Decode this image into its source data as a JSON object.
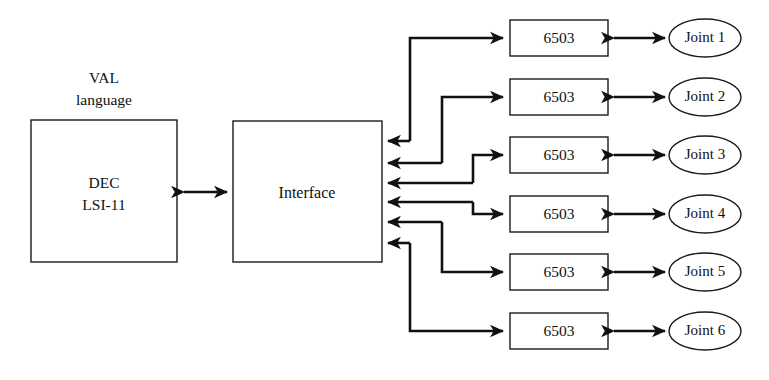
{
  "diagram": {
    "background_color": "#ffffff",
    "line_color": "#111111",
    "text_color": "#101010",
    "annotation": {
      "val_label_line1": "VAL",
      "val_label_line2": "language"
    },
    "computer": {
      "label_line1": "DEC",
      "label_line2": "LSI-11"
    },
    "interface": {
      "label": "Interface"
    },
    "processors": [
      {
        "label": "6503"
      },
      {
        "label": "6503"
      },
      {
        "label": "6503"
      },
      {
        "label": "6503"
      },
      {
        "label": "6503"
      },
      {
        "label": "6503"
      }
    ],
    "joints": [
      {
        "label": "Joint 1"
      },
      {
        "label": "Joint 2"
      },
      {
        "label": "Joint 3"
      },
      {
        "label": "Joint 4"
      },
      {
        "label": "Joint 5"
      },
      {
        "label": "Joint 6"
      }
    ],
    "connections": [
      {
        "from": "DEC LSI-11",
        "to": "Interface",
        "style": "double-arrow"
      },
      {
        "from": "Interface",
        "to": "6503 #1",
        "style": "routed-arrow"
      },
      {
        "from": "Interface",
        "to": "6503 #2",
        "style": "routed-arrow"
      },
      {
        "from": "Interface",
        "to": "6503 #3",
        "style": "routed-arrow"
      },
      {
        "from": "Interface",
        "to": "6503 #4",
        "style": "routed-arrow"
      },
      {
        "from": "Interface",
        "to": "6503 #5",
        "style": "routed-arrow"
      },
      {
        "from": "Interface",
        "to": "6503 #6",
        "style": "routed-arrow"
      },
      {
        "from": "6503 #1",
        "to": "Joint 1",
        "style": "double-arrow"
      },
      {
        "from": "6503 #2",
        "to": "Joint 2",
        "style": "double-arrow"
      },
      {
        "from": "6503 #3",
        "to": "Joint 3",
        "style": "double-arrow"
      },
      {
        "from": "6503 #4",
        "to": "Joint 4",
        "style": "double-arrow"
      },
      {
        "from": "6503 #5",
        "to": "Joint 5",
        "style": "double-arrow"
      },
      {
        "from": "6503 #6",
        "to": "Joint 6",
        "style": "double-arrow"
      }
    ]
  }
}
